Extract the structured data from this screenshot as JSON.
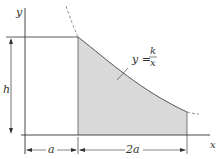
{
  "figure": {
    "labels": {
      "y_axis": "y",
      "x_axis": "x",
      "height": "h",
      "left_width": "a",
      "shaded_width": "2a",
      "equation_lhs": "y =",
      "equation_num": "k",
      "equation_den": "x"
    },
    "colors": {
      "line": "#333333",
      "shade": "#d9d9d9",
      "curve": "#555555"
    }
  }
}
